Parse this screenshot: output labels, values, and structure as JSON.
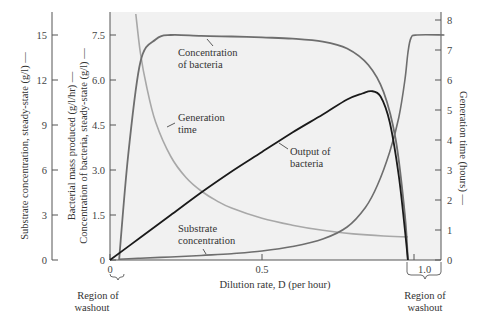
{
  "chart_data": {
    "type": "line",
    "title": "",
    "xlabel": "Dilution rate, D (per hour)",
    "xlim": [
      0,
      1.1
    ],
    "xticks": [
      {
        "value": 0,
        "label": "0"
      },
      {
        "value": 0.5,
        "label": "0.5"
      },
      {
        "value": 1.0,
        "label": "1.0"
      }
    ],
    "grid": false,
    "legend": "none (inline annotations)",
    "axes": {
      "left_outer": {
        "label": "Substrate concentration, steady-state (g/l) —",
        "ylim": [
          0,
          16.5
        ],
        "ticks": [
          "0",
          "3",
          "6",
          "9",
          "12",
          "15"
        ]
      },
      "left_inner": {
        "label_line1": "Bacterial mass produced (g/l/hr) —",
        "label_line2": "Concentration of bacteria, steady-state (g/l) —",
        "ylim": [
          0,
          8.25
        ],
        "ticks": [
          "0",
          "1.5",
          "3.0",
          "4.5",
          "6.0",
          "7.5"
        ]
      },
      "right": {
        "label": "Generation time (hours) —",
        "ylim": [
          0,
          8.2
        ],
        "ticks": [
          "0",
          "1",
          "2",
          "3",
          "4",
          "5",
          "6",
          "7",
          "8"
        ]
      }
    },
    "series": [
      {
        "name": "Concentration of bacteria",
        "axis": "left_inner",
        "color": "#6e6e6e",
        "x": [
          0.03,
          0.06,
          0.1,
          0.15,
          0.2,
          0.3,
          0.4,
          0.5,
          0.6,
          0.7,
          0.78,
          0.85,
          0.9,
          0.94,
          0.97,
          0.98
        ],
        "y": [
          0.0,
          3.5,
          6.6,
          7.35,
          7.5,
          7.47,
          7.45,
          7.42,
          7.38,
          7.28,
          7.05,
          6.5,
          5.6,
          4.0,
          1.5,
          0.0
        ]
      },
      {
        "name": "Output of bacteria",
        "axis": "left_inner",
        "color": "#1a1a1a",
        "x": [
          0.0,
          0.1,
          0.2,
          0.3,
          0.4,
          0.5,
          0.6,
          0.7,
          0.78,
          0.83,
          0.86,
          0.89,
          0.92,
          0.95,
          0.97,
          0.98
        ],
        "y": [
          0.0,
          0.75,
          1.5,
          2.25,
          2.95,
          3.6,
          4.25,
          4.85,
          5.35,
          5.55,
          5.63,
          5.45,
          4.6,
          2.8,
          1.0,
          0.0
        ]
      },
      {
        "name": "Substrate concentration",
        "axis": "left_outer",
        "color": "#6e6e6e",
        "x": [
          0.03,
          0.1,
          0.2,
          0.3,
          0.4,
          0.5,
          0.6,
          0.7,
          0.78,
          0.84,
          0.88,
          0.92,
          0.95,
          0.97,
          0.98,
          0.99,
          1.01,
          1.1
        ],
        "y": [
          0.05,
          0.12,
          0.2,
          0.3,
          0.42,
          0.6,
          0.9,
          1.4,
          2.2,
          3.5,
          5.0,
          7.2,
          9.5,
          12.0,
          13.8,
          14.8,
          15.0,
          15.0
        ]
      },
      {
        "name": "Generation time",
        "axis": "right",
        "color": "#a8a8a8",
        "x": [
          0.085,
          0.1,
          0.12,
          0.15,
          0.2,
          0.25,
          0.3,
          0.35,
          0.4,
          0.5,
          0.6,
          0.7,
          0.8,
          0.9,
          0.98
        ],
        "y": [
          8.2,
          6.9,
          5.8,
          4.6,
          3.45,
          2.75,
          2.3,
          1.98,
          1.73,
          1.39,
          1.16,
          0.99,
          0.87,
          0.8,
          0.77
        ]
      }
    ],
    "annotations": [
      {
        "text_lines": [
          "Concentration",
          "of bacteria"
        ]
      },
      {
        "text_lines": [
          "Generation",
          "time"
        ]
      },
      {
        "text_lines": [
          "Output of",
          "bacteria"
        ]
      },
      {
        "text_lines": [
          "Substrate",
          "concentration"
        ]
      },
      {
        "text_lines": [
          "Region of",
          "washout"
        ],
        "position": "left, D≈0 to 0.03"
      },
      {
        "text_lines": [
          "Region of",
          "washout"
        ],
        "position": "right, D≈0.98 to 1.1"
      }
    ]
  },
  "labels": {
    "x_title": "Dilution rate, D (per hour)",
    "left_outer_title": "Substrate concentration, steady-state (g/l) —",
    "left_inner_title_1": "Bacterial mass produced (g/l/hr) —",
    "left_inner_title_2": "Concentration of bacteria, steady-state (g/l) —",
    "right_title": "Generation time (hours) —",
    "annot_bacteria_1": "Concentration",
    "annot_bacteria_2": "of bacteria",
    "annot_gen_1": "Generation",
    "annot_gen_2": "time",
    "annot_output_1": "Output of",
    "annot_output_2": "bacteria",
    "annot_substrate_1": "Substrate",
    "annot_substrate_2": "concentration",
    "washout_left_1": "Region of",
    "washout_left_2": "washout",
    "washout_right_1": "Region of",
    "washout_right_2": "washout"
  },
  "colors": {
    "plot_bg": "#f1f1f1",
    "axis": "#555555",
    "bacteria": "#6e6e6e",
    "output": "#1a1a1a",
    "substrate": "#6e6e6e",
    "generation": "#a8a8a8"
  }
}
